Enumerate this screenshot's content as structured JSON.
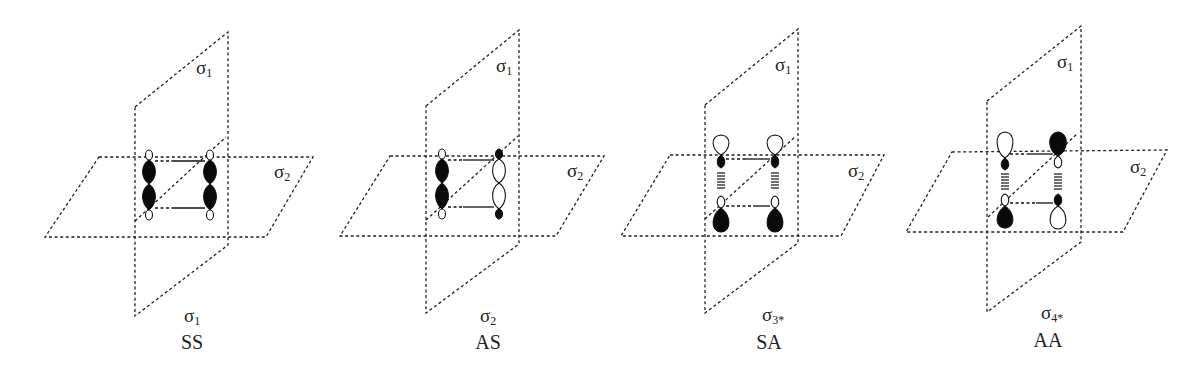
{
  "figure": {
    "panels": [
      {
        "id": "SS",
        "plane_vertical_label": {
          "sym": "σ",
          "sub": "1"
        },
        "plane_horizontal_label": {
          "sym": "σ",
          "sub": "2"
        },
        "orbital_label": {
          "sym": "σ",
          "sub": "1"
        },
        "symmetry_label": "SS"
      },
      {
        "id": "AS",
        "plane_vertical_label": {
          "sym": "σ",
          "sub": "1"
        },
        "plane_horizontal_label": {
          "sym": "σ",
          "sub": "2"
        },
        "orbital_label": {
          "sym": "σ",
          "sub": "2"
        },
        "symmetry_label": "AS"
      },
      {
        "id": "SA",
        "plane_vertical_label": {
          "sym": "σ",
          "sub": "1"
        },
        "plane_horizontal_label": {
          "sym": "σ",
          "sub": "2"
        },
        "orbital_label": {
          "sym": "σ",
          "sub": "3*"
        },
        "symmetry_label": "SA"
      },
      {
        "id": "AA",
        "plane_vertical_label": {
          "sym": "σ",
          "sub": "1"
        },
        "plane_horizontal_label": {
          "sym": "σ",
          "sub": "2"
        },
        "orbital_label": {
          "sym": "σ",
          "sub": "4*"
        },
        "symmetry_label": "AA"
      }
    ],
    "colors": {
      "line": "#222222",
      "lobe_filled": "#0a0a0a",
      "lobe_empty": "#ffffff",
      "background": "#ffffff"
    }
  }
}
